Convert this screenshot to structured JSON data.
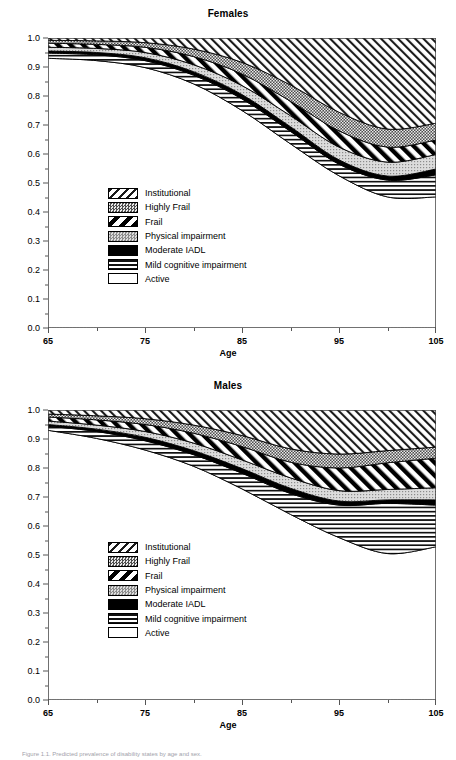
{
  "figure": {
    "caption": "Figure 1.1. Predicted prevalence of disability states by age and sex."
  },
  "legend": {
    "items": [
      {
        "label": "Institutional",
        "pattern": "diagonal-hatch-light",
        "color": "#000000"
      },
      {
        "label": "Highly Frail",
        "pattern": "dark-stipple",
        "color": "#595959"
      },
      {
        "label": "Frail",
        "pattern": "bold-diagonal-stripes",
        "color": "#000000"
      },
      {
        "label": "Physical impairment",
        "pattern": "light-stipple",
        "color": "#d9d9d9"
      },
      {
        "label": "Moderate IADL",
        "pattern": "solid-black",
        "color": "#000000"
      },
      {
        "label": "Mild cognitive impairment",
        "pattern": "horizontal-lines",
        "color": "#000000"
      },
      {
        "label": "Active",
        "pattern": "white",
        "color": "#ffffff"
      }
    ]
  },
  "chart_data": [
    {
      "type": "area",
      "title": "Females",
      "xlabel": "Age",
      "ylabel": "",
      "xlim": [
        65,
        105
      ],
      "ylim": [
        0.0,
        1.0
      ],
      "xticks": [
        65,
        75,
        85,
        95,
        105
      ],
      "xticks_minor": [
        70,
        80,
        90,
        100
      ],
      "yticks": [
        0.0,
        0.1,
        0.2,
        0.3,
        0.4,
        0.5,
        0.6,
        0.7,
        0.8,
        0.9,
        1.0
      ],
      "grid": false,
      "legend_position": "center-left",
      "stacking": "cumulative-from-bottom",
      "x": [
        65,
        70,
        75,
        80,
        85,
        90,
        95,
        100,
        105
      ],
      "series": [
        {
          "name": "Active",
          "cumulative": [
            0.93,
            0.922,
            0.898,
            0.842,
            0.75,
            0.635,
            0.525,
            0.452,
            0.452
          ]
        },
        {
          "name": "Mild cognitive impairment",
          "cumulative": [
            0.948,
            0.942,
            0.922,
            0.872,
            0.79,
            0.678,
            0.565,
            0.51,
            0.528
          ]
        },
        {
          "name": "Moderate IADL",
          "cumulative": [
            0.955,
            0.95,
            0.932,
            0.884,
            0.805,
            0.694,
            0.58,
            0.524,
            0.548
          ]
        },
        {
          "name": "Physical impairment",
          "cumulative": [
            0.968,
            0.964,
            0.95,
            0.908,
            0.836,
            0.732,
            0.624,
            0.572,
            0.598
          ]
        },
        {
          "name": "Frail",
          "cumulative": [
            0.982,
            0.978,
            0.968,
            0.936,
            0.876,
            0.782,
            0.68,
            0.624,
            0.648
          ]
        },
        {
          "name": "Highly Frail",
          "cumulative": [
            0.992,
            0.99,
            0.984,
            0.962,
            0.916,
            0.838,
            0.744,
            0.686,
            0.706
          ]
        },
        {
          "name": "Institutional",
          "cumulative": [
            1.0,
            1.0,
            1.0,
            1.0,
            1.0,
            1.0,
            1.0,
            1.0,
            1.0
          ]
        }
      ]
    },
    {
      "type": "area",
      "title": "Males",
      "xlabel": "Age",
      "ylabel": "",
      "xlim": [
        65,
        105
      ],
      "ylim": [
        0.0,
        1.0
      ],
      "xticks": [
        65,
        75,
        85,
        95,
        105
      ],
      "xticks_minor": [
        70,
        80,
        90,
        100
      ],
      "yticks": [
        0.0,
        0.1,
        0.2,
        0.3,
        0.4,
        0.5,
        0.6,
        0.7,
        0.8,
        0.9,
        1.0
      ],
      "grid": false,
      "legend_position": "center-left",
      "stacking": "cumulative-from-bottom",
      "x": [
        65,
        70,
        75,
        80,
        85,
        90,
        95,
        100,
        105
      ],
      "series": [
        {
          "name": "Active",
          "cumulative": [
            0.93,
            0.902,
            0.862,
            0.806,
            0.728,
            0.64,
            0.56,
            0.505,
            0.528
          ]
        },
        {
          "name": "Mild cognitive impairment",
          "cumulative": [
            0.944,
            0.926,
            0.894,
            0.846,
            0.782,
            0.712,
            0.672,
            0.678,
            0.672
          ]
        },
        {
          "name": "Moderate IADL",
          "cumulative": [
            0.95,
            0.934,
            0.906,
            0.86,
            0.798,
            0.73,
            0.686,
            0.69,
            0.69
          ]
        },
        {
          "name": "Physical impairment",
          "cumulative": [
            0.962,
            0.948,
            0.926,
            0.886,
            0.828,
            0.766,
            0.722,
            0.726,
            0.732
          ]
        },
        {
          "name": "Frail",
          "cumulative": [
            0.976,
            0.966,
            0.95,
            0.92,
            0.874,
            0.82,
            0.8,
            0.818,
            0.834
          ]
        },
        {
          "name": "Highly Frail",
          "cumulative": [
            0.986,
            0.98,
            0.97,
            0.948,
            0.912,
            0.866,
            0.848,
            0.86,
            0.872
          ]
        },
        {
          "name": "Institutional",
          "cumulative": [
            1.0,
            1.0,
            1.0,
            1.0,
            1.0,
            1.0,
            1.0,
            1.0,
            1.0
          ]
        }
      ]
    }
  ]
}
